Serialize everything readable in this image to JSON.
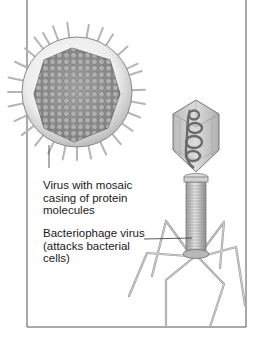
{
  "figure": {
    "labels": {
      "mosaic_virus": {
        "lines": [
          "Virus with mosaic",
          "casing of protein",
          "molecules"
        ]
      },
      "bacteriophage": {
        "lines": [
          "Bacteriophage virus",
          "(attacks bacterial",
          "cells)"
        ]
      }
    },
    "colors": {
      "frame": "#555555",
      "envelope_outer": "#d9d9d9",
      "envelope_inner": "#f2f2f2",
      "capsid": "#8a8a8a",
      "capsid_cell": "#a9a9a9",
      "phage_head": "#c8c8c8",
      "phage_dna": "#6a6a6a",
      "text": "#1a1a1a"
    }
  }
}
